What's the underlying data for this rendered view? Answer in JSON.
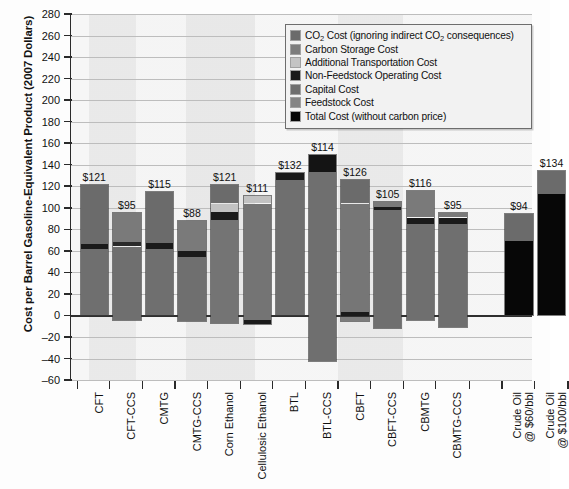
{
  "chart_data": {
    "type": "bar",
    "stacked": true,
    "title": "",
    "xlabel": "",
    "ylabel": "Cost per Barrel Gasoline-Equivalent Product (2007 Dollars)",
    "ylim": [
      -60,
      280
    ],
    "ytick_step": 20,
    "yticks": [
      280,
      260,
      240,
      220,
      200,
      180,
      160,
      140,
      120,
      100,
      80,
      60,
      40,
      20,
      0,
      -20,
      -40,
      -60
    ],
    "grid": true,
    "legend_position": "top-right",
    "categories": [
      "CFT",
      "CFT-CCS",
      "CMTG",
      "CMTG-CCS",
      "Corn Ethanol",
      "Cellulosic Ethanol",
      "BTL",
      "BTL-CCS",
      "CBFT",
      "CBFT-CCS",
      "CBMTG",
      "CBMTG-CCS",
      "Crude Oil\n@ $60/bbl",
      "Crude Oil\n@ $100/bbl"
    ],
    "series": [
      {
        "name": "CO₂ Cost (ignoring indirect CO₂ consequences)",
        "color": "#6b6b6b"
      },
      {
        "name": "Carbon Storage Cost",
        "color": "#7a7a7a"
      },
      {
        "name": "Additional Transportation Cost",
        "color": "#c2c2c2"
      },
      {
        "name": "Non-Feedstock Operating Cost",
        "color": "#1a1a1a"
      },
      {
        "name": "Capital Cost",
        "color": "#6f6f6f"
      },
      {
        "name": "Feedstock Cost",
        "color": "#808080"
      },
      {
        "name": "Total Cost (without carbon price)",
        "color": "#070707"
      }
    ],
    "value_labels": [
      "$121",
      "$95",
      "$115",
      "$88",
      "$121",
      "$111",
      "$132",
      "$114",
      "$126",
      "$105",
      "$116",
      "$95",
      "$94",
      "$134"
    ],
    "totals": [
      121,
      95,
      115,
      88,
      121,
      111,
      132,
      114,
      126,
      105,
      116,
      95,
      94,
      134
    ],
    "bars": [
      {
        "category": "CFT",
        "label": "$121",
        "top": 121,
        "bottom": 0,
        "segments": [
          {
            "series": "CO₂ Cost (ignoring indirect CO₂ consequences)",
            "from": 66,
            "to": 121,
            "color": "#6b6b6b"
          },
          {
            "series": "Non-Feedstock Operating Cost",
            "from": 62,
            "to": 66,
            "color": "#1a1a1a"
          },
          {
            "series": "Capital Cost",
            "from": 0,
            "to": 62,
            "color": "#6f6f6f"
          }
        ]
      },
      {
        "category": "CFT-CCS",
        "label": "$95",
        "top": 95,
        "bottom": -4,
        "segments": [
          {
            "series": "Carbon Storage Cost",
            "from": 68,
            "to": 95,
            "color": "#7a7a7a"
          },
          {
            "series": "Non-Feedstock Operating Cost",
            "from": 64,
            "to": 68,
            "color": "#2a2a2a"
          },
          {
            "series": "Capital Cost",
            "from": -4,
            "to": 64,
            "color": "#6f6f6f"
          }
        ]
      },
      {
        "category": "CMTG",
        "label": "$115",
        "top": 115,
        "bottom": 0,
        "segments": [
          {
            "series": "CO₂ Cost (ignoring indirect CO₂ consequences)",
            "from": 67,
            "to": 115,
            "color": "#6b6b6b"
          },
          {
            "series": "Non-Feedstock Operating Cost",
            "from": 62,
            "to": 67,
            "color": "#1a1a1a"
          },
          {
            "series": "Capital Cost",
            "from": 0,
            "to": 62,
            "color": "#6f6f6f"
          }
        ]
      },
      {
        "category": "CMTG-CCS",
        "label": "$88",
        "top": 88,
        "bottom": -5,
        "segments": [
          {
            "series": "Carbon Storage Cost",
            "from": 60,
            "to": 88,
            "color": "#7a7a7a"
          },
          {
            "series": "Non-Feedstock Operating Cost",
            "from": 54,
            "to": 60,
            "color": "#1a1a1a"
          },
          {
            "series": "Capital Cost",
            "from": -5,
            "to": 54,
            "color": "#6f6f6f"
          }
        ]
      },
      {
        "category": "Corn Ethanol",
        "label": "$121",
        "top": 121,
        "bottom": -7,
        "segments": [
          {
            "series": "CO₂ Cost (ignoring indirect CO₂ consequences)",
            "from": 104,
            "to": 121,
            "color": "#6b6b6b"
          },
          {
            "series": "Additional Transportation Cost",
            "from": 96,
            "to": 104,
            "color": "#c2c2c2"
          },
          {
            "series": "Non-Feedstock Operating Cost",
            "from": 89,
            "to": 96,
            "color": "#1a1a1a"
          },
          {
            "series": "Feedstock Cost",
            "from": -7,
            "to": 89,
            "color": "#747474"
          }
        ]
      },
      {
        "category": "Cellulosic Ethanol",
        "label": "$111",
        "top": 111,
        "bottom": -8,
        "segments": [
          {
            "series": "Additional Transportation Cost",
            "from": 104,
            "to": 111,
            "color": "#c2c2c2"
          },
          {
            "series": "Feedstock Cost",
            "from": -4,
            "to": 104,
            "color": "#747474"
          },
          {
            "series": "Non-Feedstock Operating Cost",
            "from": -8,
            "to": -4,
            "color": "#1a1a1a"
          }
        ]
      },
      {
        "category": "BTL",
        "label": "$132",
        "top": 132,
        "bottom": 0,
        "segments": [
          {
            "series": "Non-Feedstock Operating Cost",
            "from": 126,
            "to": 132,
            "color": "#1a1a1a"
          },
          {
            "series": "Capital Cost",
            "from": 0,
            "to": 126,
            "color": "#6f6f6f"
          }
        ]
      },
      {
        "category": "BTL-CCS",
        "label": "$114",
        "top": 149,
        "bottom": -42,
        "segments": [
          {
            "series": "Non-Feedstock Operating Cost",
            "from": 133,
            "to": 149,
            "color": "#141414"
          },
          {
            "series": "Capital Cost",
            "from": -42,
            "to": 133,
            "color": "#6f6f6f"
          }
        ]
      },
      {
        "category": "CBFT",
        "label": "$126",
        "top": 126,
        "bottom": -5,
        "segments": [
          {
            "series": "CO₂ Cost (ignoring indirect CO₂ consequences)",
            "from": 104,
            "to": 126,
            "color": "#6b6b6b"
          },
          {
            "series": "Capital Cost",
            "from": 3,
            "to": 104,
            "color": "#767676"
          },
          {
            "series": "Non-Feedstock Operating Cost",
            "from": -1,
            "to": 3,
            "color": "#1a1a1a"
          },
          {
            "series": "Feedstock Cost",
            "from": -5,
            "to": -1,
            "color": "#7d7d7d"
          }
        ]
      },
      {
        "category": "CBFT-CCS",
        "label": "$105",
        "top": 105,
        "bottom": -12,
        "segments": [
          {
            "series": "Carbon Storage Cost",
            "from": 101,
            "to": 105,
            "color": "#7a7a7a"
          },
          {
            "series": "Non-Feedstock Operating Cost",
            "from": 98,
            "to": 101,
            "color": "#1a1a1a"
          },
          {
            "series": "Capital Cost",
            "from": -12,
            "to": 98,
            "color": "#6f6f6f"
          }
        ]
      },
      {
        "category": "CBMTG",
        "label": "$116",
        "top": 116,
        "bottom": -4,
        "segments": [
          {
            "series": "CO₂ Cost (ignoring indirect CO₂ consequences)",
            "from": 91,
            "to": 116,
            "color": "#7a7a7a"
          },
          {
            "series": "Non-Feedstock Operating Cost",
            "from": 85,
            "to": 91,
            "color": "#1a1a1a"
          },
          {
            "series": "Capital Cost",
            "from": -4,
            "to": 85,
            "color": "#6f6f6f"
          }
        ]
      },
      {
        "category": "CBMTG-CCS",
        "label": "$95",
        "top": 95,
        "bottom": -11,
        "segments": [
          {
            "series": "Carbon Storage Cost",
            "from": 91,
            "to": 95,
            "color": "#7a7a7a"
          },
          {
            "series": "Non-Feedstock Operating Cost",
            "from": 85,
            "to": 91,
            "color": "#1a1a1a"
          },
          {
            "series": "Capital Cost",
            "from": -11,
            "to": 85,
            "color": "#6f6f6f"
          }
        ]
      },
      {
        "category": "Crude Oil @ $60/bbl",
        "label": "$94",
        "top": 94,
        "bottom": 0,
        "segments": [
          {
            "series": "CO₂ Cost (ignoring indirect CO₂ consequences)",
            "from": 69,
            "to": 94,
            "color": "#6b6b6b"
          },
          {
            "series": "Total Cost (without carbon price)",
            "from": 0,
            "to": 69,
            "color": "#070707"
          }
        ]
      },
      {
        "category": "Crude Oil @ $100/bbl",
        "label": "$134",
        "top": 134,
        "bottom": 0,
        "segments": [
          {
            "series": "CO₂ Cost (ignoring indirect CO₂ consequences)",
            "from": 113,
            "to": 134,
            "color": "#6b6b6b"
          },
          {
            "series": "Total Cost (without carbon price)",
            "from": 0,
            "to": 113,
            "color": "#070707"
          }
        ]
      }
    ]
  },
  "legend": {
    "items": [
      {
        "label_html": "CO<sub>2</sub> Cost (ignoring indirect CO<sub>2</sub> consequences)",
        "color": "#6b6b6b"
      },
      {
        "label_html": "Carbon Storage Cost",
        "color": "#7d7d7d"
      },
      {
        "label_html": "Additional Transportation Cost",
        "color": "#c4c4c4"
      },
      {
        "label_html": "Non-Feedstock Operating Cost",
        "color": "#1a1a1a"
      },
      {
        "label_html": "Capital Cost",
        "color": "#6f6f6f"
      },
      {
        "label_html": "Feedstock Cost",
        "color": "#858585"
      },
      {
        "label_html": "Total Cost (without carbon price)",
        "color": "#070707"
      }
    ]
  }
}
